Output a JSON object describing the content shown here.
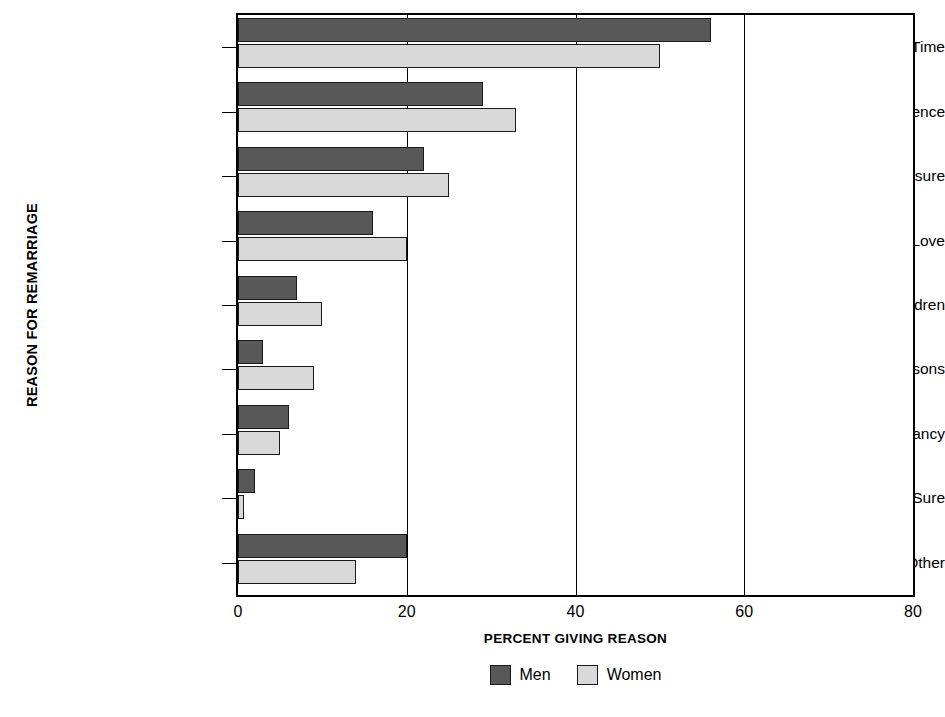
{
  "chart_data": {
    "type": "bar",
    "orientation": "horizontal",
    "title": "",
    "xlabel": "PERCENT GIVING REASON",
    "ylabel": "REASON FOR REMARRIAGE",
    "xlim": [
      0,
      80
    ],
    "ylim": null,
    "xticks": [
      0,
      20,
      40,
      60,
      80
    ],
    "xtick_labels": [
      "0",
      "20",
      "40",
      "60",
      "80"
    ],
    "grid": "vertical gridlines at 20, 40, 60",
    "legend_position": "bottom-center",
    "categories": [
      "It Was Time",
      "Convenience",
      "Social Pressure",
      "Love",
      "Help with Children",
      "Legal Reasons",
      "Pregnancy",
      "Not Sure",
      "Other"
    ],
    "series": [
      {
        "name": "Men",
        "color": "#585858",
        "values": [
          56,
          29,
          22,
          16,
          7,
          3,
          6,
          2,
          20
        ]
      },
      {
        "name": "Women",
        "color": "#d9d9d9",
        "values": [
          50,
          33,
          25,
          20,
          10,
          9,
          5,
          0.7,
          14
        ]
      }
    ]
  },
  "axes": {
    "ylabel": "REASON FOR REMARRIAGE",
    "xlabel": "PERCENT GIVING REASON"
  },
  "legend": {
    "entries": [
      {
        "label": "Men",
        "color": "#585858"
      },
      {
        "label": "Women",
        "color": "#d9d9d9"
      }
    ]
  }
}
